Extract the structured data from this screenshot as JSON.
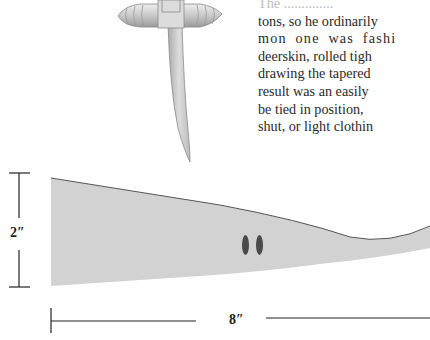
{
  "page": {
    "text_lines": [
      "The ..............",
      "tons, so he ordinarily",
      "mon one was fashi",
      "deerskin, rolled tigh",
      "drawing the tapered",
      "result was an easily",
      "be tied in position,",
      "shut, or light clothin"
    ]
  },
  "figure": {
    "height_label": "2″",
    "length_label": "8″",
    "colors": {
      "strip_fill": "#d2d2d2",
      "outline": "#555555",
      "hole": "#4a4a4a",
      "ink": "#222222"
    }
  }
}
